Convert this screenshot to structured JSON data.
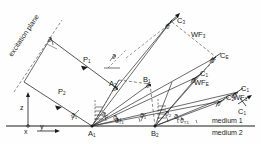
{
  "figure": {
    "type": "ray-diagram"
  },
  "labels": {
    "excitation_plane": "excitation plane",
    "medium1": "medium 1",
    "medium2": "medium 2",
    "axis_z": "z",
    "axis_x": "x",
    "axis_y": "y",
    "point_a1": "A",
    "point_a1_sub": "1",
    "point_a2": "A",
    "point_a2_sub": "2",
    "point_b1": "B",
    "point_b1_sub": "1",
    "point_b2": "B",
    "point_b2_sub": "2",
    "beam_p1": "P",
    "beam_p1_sub": "1",
    "beam_p2": "P",
    "beam_p2_sub": "2",
    "ray_c1": "C",
    "ray_c1_sub": "1",
    "ray_c2": "C",
    "ray_c2_sub": "2",
    "ray_c3": "C",
    "ray_c3_sub": "3",
    "ray_ce": "C",
    "ray_ce_sub": "E",
    "ray_c1b": "C",
    "ray_c1b_sub": "1",
    "wf1": "WF",
    "wf1_sub": "1",
    "wf2": "WF",
    "wf2_sub": "2",
    "wf3": "WF",
    "wf3_sub": "3",
    "wfe": "WF",
    "wfe_sub": "E"
  },
  "angles": {
    "theta": "ϑ",
    "a1_left_1": "ϑ",
    "a1_left_1_sub": "1",
    "a1_mid": "ϑ",
    "a1_mid_sub": "2",
    "a1_right": "ϑ",
    "a1_right_sub": "L1",
    "a1_far_right": "ϑ",
    "a1_far_right_sub": "T1",
    "b2_left": "ϑ",
    "b2_left_sub": "1",
    "b2_mid": "ϑ",
    "b2_mid_sub": "2",
    "b2_right": "ϑ",
    "b2_right_sub": "L1",
    "b2_far_right": "ϑ",
    "b2_far_right_sub": "T1",
    "a2_angle": "ϑ",
    "b1_angle": "ϑ",
    "top_angle": "ϑ",
    "exc_angle": "ϑ",
    "ce_angle": "ϑ",
    "c1_angle": "ϑ",
    "c2_angle": "ϑ",
    "c1b_angle": "ϑ",
    "c3_angle": "ϑ"
  },
  "colors": {
    "ink": "#1a1a1a",
    "line": "#2b2b2b",
    "dashed": "#555555",
    "background": "#fefefe"
  }
}
